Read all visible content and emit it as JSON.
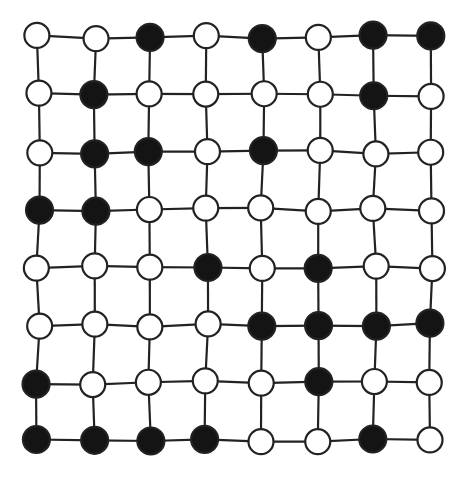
{
  "diagram": {
    "type": "lattice-graph",
    "rows": 8,
    "cols": 8,
    "node_states": [
      [
        "open",
        "open",
        "filled",
        "open",
        "filled",
        "open",
        "filled",
        "filled"
      ],
      [
        "open",
        "filled",
        "open",
        "open",
        "open",
        "open",
        "filled",
        "open"
      ],
      [
        "open",
        "filled",
        "filled",
        "open",
        "filled",
        "open",
        "open",
        "open"
      ],
      [
        "filled",
        "filled",
        "open",
        "open",
        "open",
        "open",
        "open",
        "open"
      ],
      [
        "open",
        "open",
        "open",
        "filled",
        "open",
        "filled",
        "open",
        "open"
      ],
      [
        "open",
        "open",
        "open",
        "open",
        "filled",
        "filled",
        "filled",
        "filled"
      ],
      [
        "filled",
        "open",
        "open",
        "open",
        "open",
        "filled",
        "open",
        "open"
      ],
      [
        "filled",
        "filled",
        "filled",
        "filled",
        "open",
        "open",
        "filled",
        "open"
      ]
    ],
    "filled_count": 24,
    "open_count": 40,
    "colors": {
      "filled_node": "#141414",
      "open_node": "#ffffff",
      "stroke": "#222222",
      "background": "#ffffff"
    }
  }
}
